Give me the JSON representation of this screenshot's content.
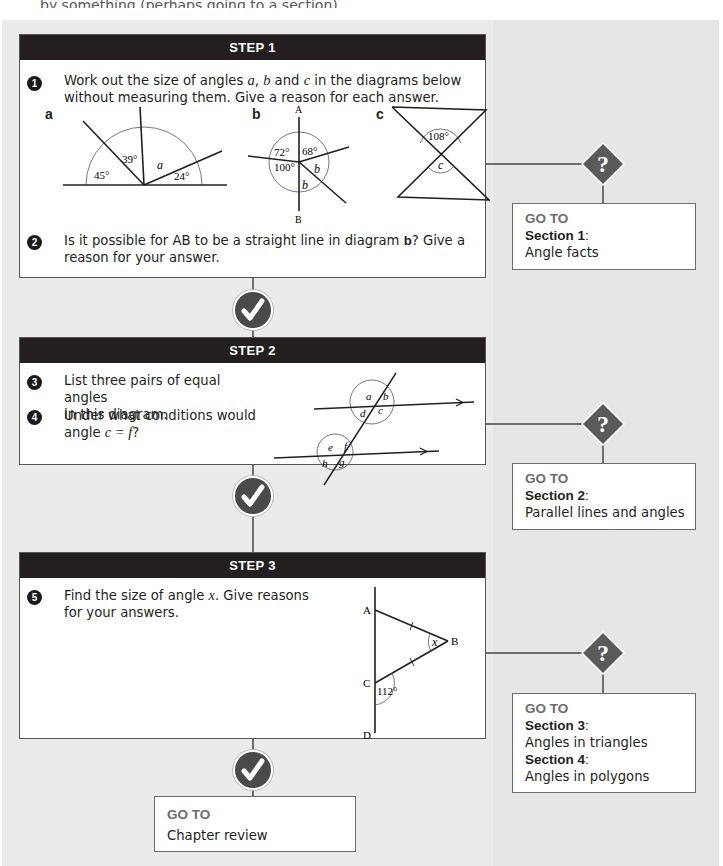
{
  "page": {
    "top_cut_text": "by something (perhaps going to a section)"
  },
  "colors": {
    "panel_bg": "#ebebeb",
    "step_header_bg": "#231f20",
    "connector": "#6d6d6d",
    "icon_fill": "#4a4a4a",
    "goto_label": "#6d6d6d"
  },
  "steps": [
    {
      "title": "STEP 1",
      "questions": [
        {
          "number": "1",
          "text_parts": [
            "Work out the size of angles ",
            "a",
            ", ",
            "b",
            " and ",
            "c",
            " in the diagrams below",
            "without measuring them. Give a reason for each answer."
          ]
        },
        {
          "number": "2",
          "text_parts": [
            "Is it possible for AB to be a straight line in diagram ",
            "b",
            "? Give a",
            "reason for your answer."
          ]
        }
      ],
      "diagrams": {
        "a": {
          "label": "a",
          "angles": [
            "45°",
            "39°",
            "a",
            "24°"
          ]
        },
        "b": {
          "label": "b",
          "points": [
            "A",
            "B"
          ],
          "angles": [
            "72°",
            "68°",
            "100°",
            "b",
            "b"
          ]
        },
        "c": {
          "label": "c",
          "angles": [
            "108°",
            "c"
          ]
        }
      }
    },
    {
      "title": "STEP 2",
      "questions": [
        {
          "number": "3",
          "text_parts": [
            "List three pairs of equal angles",
            "in this diagram."
          ]
        },
        {
          "number": "4",
          "text_parts": [
            "Under what conditions would",
            "angle ",
            "c = f",
            "?"
          ]
        }
      ],
      "diagram": {
        "angles": [
          "a",
          "b",
          "c",
          "d",
          "e",
          "f",
          "g",
          "h"
        ]
      }
    },
    {
      "title": "STEP 3",
      "questions": [
        {
          "number": "5",
          "text_parts": [
            "Find the size of angle ",
            "x",
            ". Give reasons",
            "for your answers."
          ]
        }
      ],
      "diagram": {
        "points": [
          "A",
          "B",
          "C",
          "D"
        ],
        "angles": [
          "x",
          "112°"
        ]
      }
    }
  ],
  "gotos": [
    {
      "heading": "GO TO",
      "lines": [
        {
          "section": "Section 1",
          "title": "Angle facts"
        }
      ]
    },
    {
      "heading": "GO TO",
      "lines": [
        {
          "section": "Section 2",
          "title": "Parallel lines and angles"
        }
      ]
    },
    {
      "heading": "GO TO",
      "lines": [
        {
          "section": "Section 3",
          "title": "Angles in triangles"
        },
        {
          "section": "Section 4",
          "title": "Angles in polygons"
        }
      ]
    },
    {
      "heading": "GO TO",
      "lines": [
        {
          "section": "",
          "title": "Chapter review"
        }
      ]
    }
  ],
  "icons": {
    "check": "check-circle-icon",
    "question": "question-diamond-icon"
  }
}
